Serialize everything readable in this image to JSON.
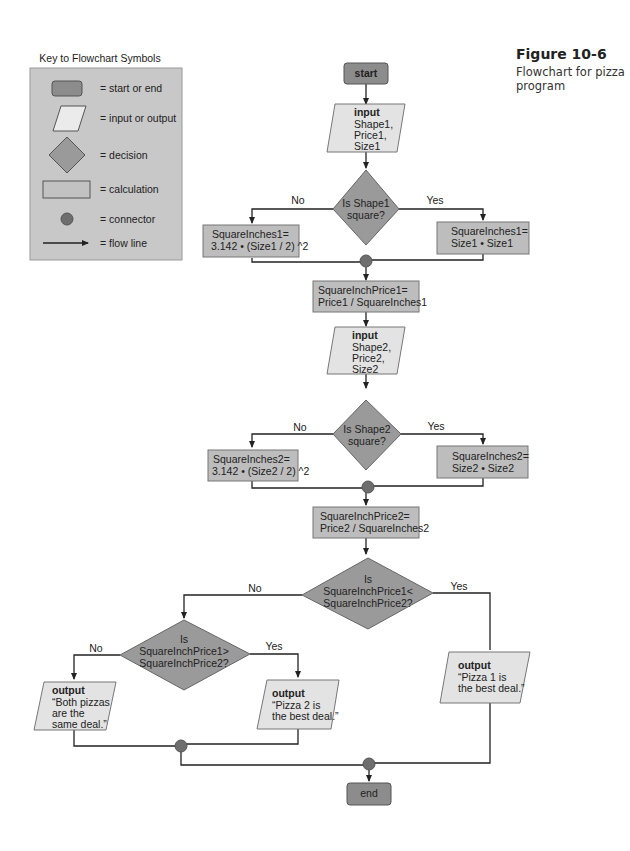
{
  "figure": {
    "number": "Figure 10-6",
    "caption": "Flowchart for pizza program"
  },
  "colors": {
    "terminal": "#8c8c8c",
    "io": "#e3e3e3",
    "decision": "#9a9a9a",
    "calculation": "#bdbdbd",
    "connector": "#6e6e6e",
    "line": "#222222",
    "key_bg": "#c8c8c8"
  },
  "key": {
    "title": "Key to Flowchart Symbols",
    "items": [
      {
        "symbol": "terminal",
        "label": "= start or end"
      },
      {
        "symbol": "parallelogram",
        "label": "= input or output"
      },
      {
        "symbol": "diamond",
        "label": "= decision"
      },
      {
        "symbol": "rectangle",
        "label": "= calculation"
      },
      {
        "symbol": "circle",
        "label": "= connector"
      },
      {
        "symbol": "arrow",
        "label": "= flow line"
      }
    ]
  },
  "flow": {
    "start": "start",
    "input1": {
      "title": "input",
      "lines": [
        "Shape1,",
        "Price1,",
        "Size1"
      ]
    },
    "decision1": {
      "lines": [
        "Is Shape1",
        "square?"
      ],
      "no": "No",
      "yes": "Yes"
    },
    "calc1_no": {
      "lines": [
        "SquareInches1=",
        "3.142 • (Size1 / 2) ^2"
      ]
    },
    "calc1_yes": {
      "lines": [
        "SquareInches1=",
        "Size1 • Size1"
      ]
    },
    "price1": {
      "lines": [
        "SquareInchPrice1=",
        "Price1 / SquareInches1"
      ]
    },
    "input2": {
      "title": "input",
      "lines": [
        "Shape2,",
        "Price2,",
        "Size2"
      ]
    },
    "decision2": {
      "lines": [
        "Is Shape2",
        "square?"
      ],
      "no": "No",
      "yes": "Yes"
    },
    "calc2_no": {
      "lines": [
        "SquareInches2=",
        "3.142 • (Size2 / 2) ^2"
      ]
    },
    "calc2_yes": {
      "lines": [
        "SquareInches2=",
        "Size2 • Size2"
      ]
    },
    "price2": {
      "lines": [
        "SquareInchPrice2=",
        "Price2 / SquareInches2"
      ]
    },
    "decision3": {
      "lines": [
        "Is",
        "SquareInchPrice1<",
        "SquareInchPrice2?"
      ],
      "no": "No",
      "yes": "Yes"
    },
    "decision4": {
      "lines": [
        "Is",
        "SquareInchPrice1>",
        "SquareInchPrice2?"
      ],
      "no": "No",
      "yes": "Yes"
    },
    "output_same": {
      "title": "output",
      "lines": [
        "“Both pizzas",
        "are the",
        "same deal.”"
      ]
    },
    "output_pizza2": {
      "title": "output",
      "lines": [
        "“Pizza 2 is",
        "the best deal.”"
      ]
    },
    "output_pizza1": {
      "title": "output",
      "lines": [
        "“Pizza 1 is",
        "the best deal.”"
      ]
    },
    "end": "end"
  }
}
